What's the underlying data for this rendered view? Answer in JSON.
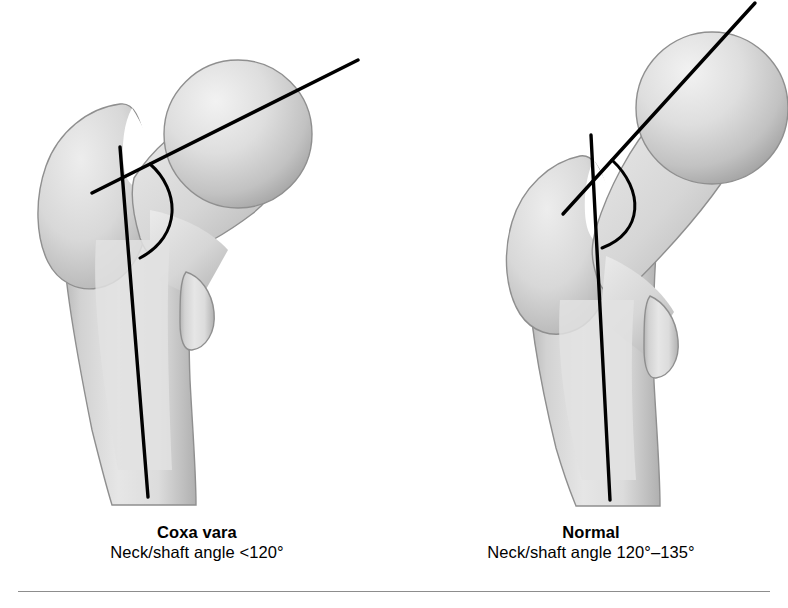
{
  "figure": {
    "type": "medical-illustration",
    "background_color": "#ffffff",
    "bone_fill_light": "#eeeeee",
    "bone_fill_mid": "#d6d6d6",
    "bone_fill_dark": "#a9a9a9",
    "bone_outline_color": "#8f8f8f",
    "axis_line_color": "#000000",
    "divider_color": "#8d8d8d"
  },
  "panels": [
    {
      "id": "left",
      "title": "Coxa vara",
      "subtitle": "Neck/shaft angle <120°",
      "angle_description": "shallow neck-shaft angle, less than 120 degrees",
      "neck_axis_degrees": 26,
      "shaft_axis_degrees": 86
    },
    {
      "id": "right",
      "title": "Normal",
      "subtitle": "Neck/shaft angle 120°–135°",
      "angle_description": "normal neck-shaft angle between 120 and 135 degrees",
      "neck_axis_degrees": 48,
      "shaft_axis_degrees": 88
    }
  ],
  "anatomy_labels": {
    "femoral_head": "femoral-head",
    "femoral_neck": "femoral-neck",
    "greater_trochanter": "greater-trochanter",
    "lesser_trochanter": "lesser-trochanter",
    "femoral_shaft": "femoral-shaft"
  }
}
